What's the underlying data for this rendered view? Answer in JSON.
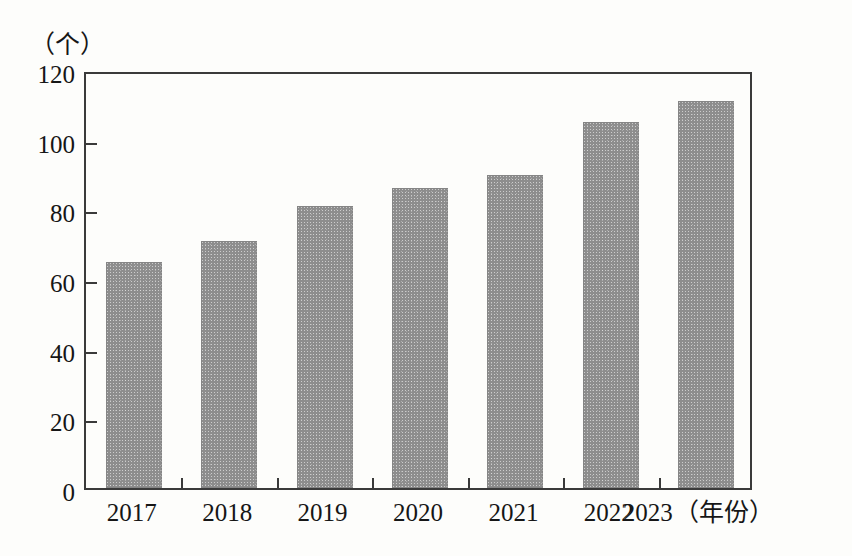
{
  "chart_data": {
    "type": "bar",
    "title": "",
    "subtitle": "",
    "xlabel": "（年份）",
    "ylabel": "（个）",
    "categories": [
      "2017",
      "2018",
      "2019",
      "2020",
      "2021",
      "2022",
      "2023"
    ],
    "values": [
      65,
      71,
      81,
      86,
      90,
      105,
      111
    ],
    "series": [
      {
        "name": "",
        "values": [
          65,
          71,
          81,
          86,
          90,
          105,
          111
        ]
      }
    ],
    "ylim": [
      0,
      120
    ],
    "y_ticks": [
      0,
      20,
      40,
      60,
      80,
      100,
      120
    ],
    "y_tick_labels": [
      "0",
      "20",
      "40",
      "60",
      "80",
      "100",
      "120"
    ],
    "grid": false,
    "legend": false,
    "legend_position": "none",
    "bar_color": "#8d8d8d",
    "axis_color": "#3a3a3a",
    "text_color": "#161616",
    "background_color": "#fdfdfb",
    "annotations": []
  },
  "axes": {
    "y_unit": "（个）",
    "x_unit": "（年份）"
  }
}
